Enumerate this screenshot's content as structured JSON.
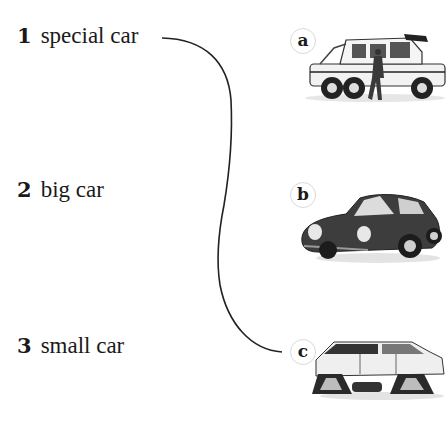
{
  "exercise": {
    "items": [
      {
        "number": "1",
        "label": "special car"
      },
      {
        "number": "2",
        "label": "big car"
      },
      {
        "number": "3",
        "label": "small car"
      }
    ],
    "pictures": [
      {
        "letter": "a",
        "description": "six-wheeled off-road truck with a man walking beside it"
      },
      {
        "letter": "b",
        "description": "dark classic sports car"
      },
      {
        "letter": "c",
        "description": "SUV with tank-style track wheels"
      }
    ],
    "connections": [
      {
        "from": "1",
        "to": "c"
      }
    ]
  }
}
